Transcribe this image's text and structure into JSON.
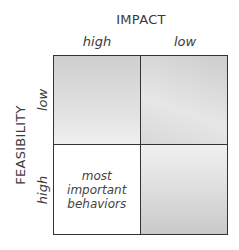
{
  "diagram": {
    "x_axis": {
      "title": "IMPACT",
      "labels": [
        "high",
        "low"
      ]
    },
    "y_axis": {
      "title": "FEASIBILITY",
      "labels": [
        "low",
        "high"
      ]
    },
    "cells": [
      {
        "position": "top-left",
        "impact": "high",
        "feasibility": "low",
        "text": "",
        "fill": "gray"
      },
      {
        "position": "top-right",
        "impact": "low",
        "feasibility": "low",
        "text": "",
        "fill": "gray"
      },
      {
        "position": "bottom-left",
        "impact": "high",
        "feasibility": "high",
        "text": [
          "most",
          "important",
          "behaviors"
        ],
        "fill": "white"
      },
      {
        "position": "bottom-right",
        "impact": "low",
        "feasibility": "high",
        "text": "",
        "fill": "gray"
      }
    ],
    "colors": {
      "border": "#333333",
      "shade_dark": "#c8c8c8",
      "shade_light": "#f0f0f0",
      "highlight": "#ffffff"
    }
  }
}
